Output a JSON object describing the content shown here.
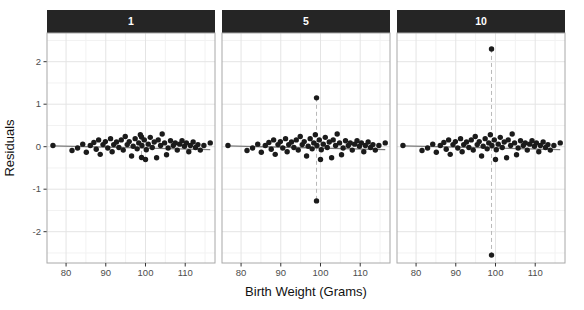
{
  "chart_data": {
    "type": "scatter",
    "title": "",
    "xlabel": "Birth Weight (Grams)",
    "ylabel": "Residuals",
    "facet_labels": [
      "1",
      "5",
      "10"
    ],
    "facet_multipliers": [
      1,
      5,
      10
    ],
    "x_ticks": [
      80,
      90,
      100,
      110
    ],
    "y_ticks": [
      2,
      1,
      0,
      -1,
      -2
    ],
    "x_minor_ticks": [
      85,
      95,
      105,
      115
    ],
    "y_minor_ticks": [
      2.5,
      1.5,
      0.5,
      -0.5,
      -1.5,
      -2.5
    ],
    "xlim": [
      75.2,
      117.5
    ],
    "ylim": [
      -2.74,
      2.68
    ],
    "grid": true,
    "legend": "none",
    "outlier_x": 99,
    "outlier_base_residuals": [
      0.23,
      -0.255
    ],
    "trend_line": {
      "x": [
        76.7,
        116.3
      ],
      "y": [
        0.02,
        -0.07
      ]
    },
    "base_points": [
      [
        76.7,
        0.03
      ],
      [
        81.5,
        -0.09
      ],
      [
        82.9,
        -0.03
      ],
      [
        84.2,
        0.06
      ],
      [
        85.1,
        -0.13
      ],
      [
        86.1,
        0.03
      ],
      [
        87.0,
        0.1
      ],
      [
        87.6,
        -0.06
      ],
      [
        88.2,
        0.16
      ],
      [
        88.6,
        -0.18
      ],
      [
        89.3,
        0.05
      ],
      [
        89.9,
        0.12
      ],
      [
        90.5,
        -0.03
      ],
      [
        91.2,
        0.19
      ],
      [
        91.6,
        -0.12
      ],
      [
        92.0,
        0.05
      ],
      [
        92.7,
        0.11
      ],
      [
        93.3,
        -0.02
      ],
      [
        93.9,
        0.16
      ],
      [
        94.4,
        -0.08
      ],
      [
        94.9,
        0.24
      ],
      [
        95.4,
        0.05
      ],
      [
        95.9,
        0.12
      ],
      [
        96.5,
        -0.22
      ],
      [
        96.9,
        0.01
      ],
      [
        97.4,
        0.19
      ],
      [
        97.9,
        -0.05
      ],
      [
        98.3,
        0.09
      ],
      [
        98.7,
        0.28
      ],
      [
        99.1,
        0.03
      ],
      [
        99.7,
        0.16
      ],
      [
        100.0,
        -0.3
      ],
      [
        100.2,
        -0.07
      ],
      [
        100.7,
        0.06
      ],
      [
        101.2,
        0.22
      ],
      [
        101.7,
        -0.02
      ],
      [
        102.2,
        0.11
      ],
      [
        102.8,
        -0.26
      ],
      [
        103.2,
        0.16
      ],
      [
        103.8,
        0.03
      ],
      [
        104.2,
        0.3
      ],
      [
        104.8,
        0.09
      ],
      [
        105.3,
        -0.19
      ],
      [
        105.7,
        -0.03
      ],
      [
        106.3,
        0.14
      ],
      [
        107.0,
        0.03
      ],
      [
        107.5,
        0.09
      ],
      [
        108.0,
        -0.08
      ],
      [
        108.6,
        0.06
      ],
      [
        109.2,
        0.14
      ],
      [
        109.8,
        0.01
      ],
      [
        110.3,
        0.09
      ],
      [
        110.9,
        -0.12
      ],
      [
        111.3,
        0.03
      ],
      [
        112.0,
        0.11
      ],
      [
        112.6,
        -0.02
      ],
      [
        113.2,
        0.05
      ],
      [
        113.8,
        -0.08
      ],
      [
        114.7,
        0.03
      ],
      [
        116.3,
        0.09
      ]
    ],
    "colors": {
      "strip_bg": "#252525",
      "strip_text": "#ffffff",
      "panel_bg": "#ffffff",
      "panel_border": "#a8a8a8",
      "grid_major": "#e4e4e4",
      "grid_minor": "#f2f2f2",
      "point": "#1b1b1b",
      "trend_line": "#7a7a7a",
      "dashed_guide": "#b8b8b8",
      "tick_label": "#4d4d4d",
      "tick_mark": "#333333"
    }
  }
}
